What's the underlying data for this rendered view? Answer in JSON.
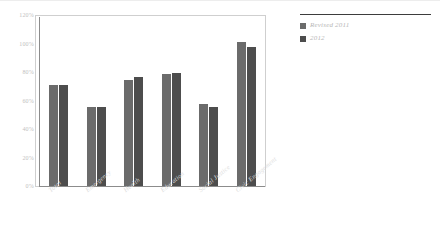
{
  "chart_data": {
    "type": "bar",
    "title": "",
    "subtitle": "",
    "xlabel": "",
    "ylabel": "",
    "ylim": [
      0,
      120
    ],
    "yticks": [
      "0%",
      "20%",
      "40%",
      "60%",
      "80%",
      "100%",
      "120%"
    ],
    "ytick_values": [
      0,
      20,
      40,
      60,
      80,
      100,
      120
    ],
    "grid": false,
    "legend_position": "right",
    "categories": [
      "Total",
      "Emergency",
      "Health",
      "Education",
      "Social Justice",
      "Civic Engagement"
    ],
    "series": [
      {
        "name": "Revised 2011",
        "color": "#6b6b6b",
        "values": [
          71,
          56,
          75,
          79,
          58,
          102
        ]
      },
      {
        "name": "2012",
        "color": "#4d4d4d",
        "values": [
          71,
          56,
          77,
          80,
          56,
          98
        ]
      }
    ]
  },
  "legend": {
    "entries": [
      {
        "label": "Revised 2011"
      },
      {
        "label": "2012"
      }
    ]
  },
  "colors": {
    "series_1": "#6b6b6b",
    "series_2": "#4d4d4d",
    "axis": "#8c8c8c",
    "frame": "#cfcfcf",
    "tick_text": "#c2c2c2",
    "category_text": "#dcdcdc",
    "legend_text": "#b8b8b8",
    "legend_rule": "#3d3d3d",
    "background": "#ffffff"
  }
}
